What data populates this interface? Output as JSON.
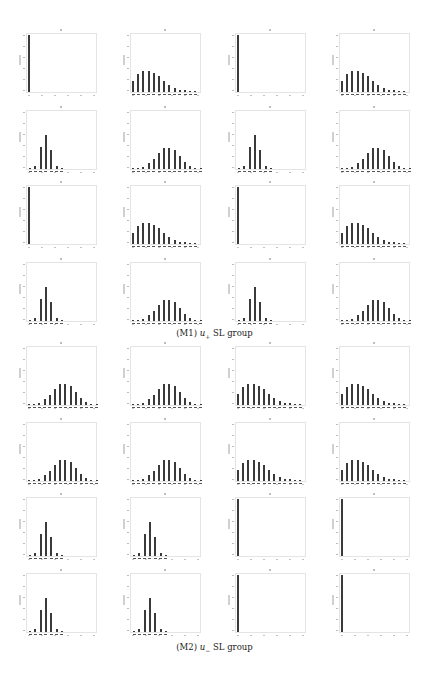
{
  "figure": {
    "panels": [
      {
        "id": "M1",
        "caption_prefix": "(M1) ",
        "caption_var": "u",
        "caption_sub": "+",
        "caption_suffix": " SL group"
      },
      {
        "id": "M2",
        "caption_prefix": "(M2) ",
        "caption_var": "u",
        "caption_sub": "−",
        "caption_suffix": " SL group"
      }
    ]
  },
  "chart_data": [
    {
      "type": "bar",
      "panel": "(M1) u+ SL group",
      "grid": {
        "rows": 4,
        "cols": 4
      },
      "layout_note": "small-multiple histograms; tick labels illegible at this resolution",
      "histograms": [
        {
          "row": 0,
          "col": 0,
          "shape": "spike",
          "values": [
            1.0
          ]
        },
        {
          "row": 0,
          "col": 1,
          "shape": "right-skewed",
          "values": [
            0.2,
            0.32,
            0.37,
            0.37,
            0.34,
            0.28,
            0.2,
            0.13,
            0.07,
            0.04,
            0.03,
            0.02,
            0.01
          ]
        },
        {
          "row": 0,
          "col": 2,
          "shape": "spike",
          "values": [
            1.0
          ]
        },
        {
          "row": 0,
          "col": 3,
          "shape": "right-skewed",
          "values": [
            0.2,
            0.32,
            0.37,
            0.37,
            0.34,
            0.28,
            0.2,
            0.13,
            0.07,
            0.04,
            0.03,
            0.02,
            0.01
          ]
        },
        {
          "row": 1,
          "col": 0,
          "shape": "narrow-peak",
          "values": [
            0.02,
            0.06,
            0.38,
            0.6,
            0.33,
            0.06,
            0.02
          ]
        },
        {
          "row": 1,
          "col": 1,
          "shape": "centered",
          "values": [
            0.01,
            0.02,
            0.04,
            0.1,
            0.18,
            0.28,
            0.36,
            0.37,
            0.33,
            0.22,
            0.12,
            0.05,
            0.02,
            0.01
          ]
        },
        {
          "row": 1,
          "col": 2,
          "shape": "narrow-peak",
          "values": [
            0.02,
            0.06,
            0.38,
            0.6,
            0.33,
            0.06,
            0.02
          ]
        },
        {
          "row": 1,
          "col": 3,
          "shape": "centered",
          "values": [
            0.01,
            0.02,
            0.04,
            0.1,
            0.18,
            0.28,
            0.36,
            0.37,
            0.33,
            0.22,
            0.12,
            0.05,
            0.02,
            0.01
          ]
        },
        {
          "row": 2,
          "col": 0,
          "shape": "spike",
          "values": [
            1.0
          ]
        },
        {
          "row": 2,
          "col": 1,
          "shape": "right-skewed",
          "values": [
            0.2,
            0.32,
            0.37,
            0.37,
            0.34,
            0.28,
            0.2,
            0.13,
            0.07,
            0.04,
            0.03,
            0.02,
            0.01
          ]
        },
        {
          "row": 2,
          "col": 2,
          "shape": "spike",
          "values": [
            1.0
          ]
        },
        {
          "row": 2,
          "col": 3,
          "shape": "right-skewed",
          "values": [
            0.2,
            0.32,
            0.37,
            0.37,
            0.34,
            0.28,
            0.2,
            0.13,
            0.07,
            0.04,
            0.03,
            0.02,
            0.01
          ]
        },
        {
          "row": 3,
          "col": 0,
          "shape": "narrow-peak",
          "values": [
            0.02,
            0.06,
            0.38,
            0.6,
            0.33,
            0.06,
            0.02
          ]
        },
        {
          "row": 3,
          "col": 1,
          "shape": "centered",
          "values": [
            0.01,
            0.02,
            0.04,
            0.1,
            0.18,
            0.28,
            0.36,
            0.37,
            0.33,
            0.22,
            0.12,
            0.05,
            0.02,
            0.01
          ]
        },
        {
          "row": 3,
          "col": 2,
          "shape": "narrow-peak",
          "values": [
            0.02,
            0.06,
            0.38,
            0.6,
            0.33,
            0.06,
            0.02
          ]
        },
        {
          "row": 3,
          "col": 3,
          "shape": "centered",
          "values": [
            0.01,
            0.02,
            0.04,
            0.1,
            0.18,
            0.28,
            0.36,
            0.37,
            0.33,
            0.22,
            0.12,
            0.05,
            0.02,
            0.01
          ]
        }
      ]
    },
    {
      "type": "bar",
      "panel": "(M2) u− SL group",
      "grid": {
        "rows": 4,
        "cols": 4
      },
      "layout_note": "small-multiple histograms; tick labels illegible at this resolution",
      "histograms": [
        {
          "row": 0,
          "col": 0,
          "shape": "centered",
          "values": [
            0.01,
            0.02,
            0.04,
            0.1,
            0.18,
            0.28,
            0.36,
            0.37,
            0.33,
            0.22,
            0.12,
            0.05,
            0.02,
            0.01
          ]
        },
        {
          "row": 0,
          "col": 1,
          "shape": "centered",
          "values": [
            0.01,
            0.02,
            0.04,
            0.1,
            0.18,
            0.28,
            0.36,
            0.37,
            0.33,
            0.22,
            0.12,
            0.05,
            0.02,
            0.01
          ]
        },
        {
          "row": 0,
          "col": 2,
          "shape": "right-skewed",
          "values": [
            0.2,
            0.32,
            0.37,
            0.37,
            0.34,
            0.28,
            0.2,
            0.13,
            0.07,
            0.04,
            0.03,
            0.02,
            0.01
          ]
        },
        {
          "row": 0,
          "col": 3,
          "shape": "right-skewed",
          "values": [
            0.2,
            0.32,
            0.37,
            0.37,
            0.34,
            0.28,
            0.2,
            0.13,
            0.07,
            0.04,
            0.03,
            0.02,
            0.01
          ]
        },
        {
          "row": 1,
          "col": 0,
          "shape": "centered",
          "values": [
            0.01,
            0.02,
            0.04,
            0.1,
            0.18,
            0.28,
            0.36,
            0.37,
            0.33,
            0.22,
            0.12,
            0.05,
            0.02,
            0.01
          ]
        },
        {
          "row": 1,
          "col": 1,
          "shape": "centered",
          "values": [
            0.01,
            0.02,
            0.04,
            0.1,
            0.18,
            0.28,
            0.36,
            0.37,
            0.33,
            0.22,
            0.12,
            0.05,
            0.02,
            0.01
          ]
        },
        {
          "row": 1,
          "col": 2,
          "shape": "right-skewed",
          "values": [
            0.2,
            0.32,
            0.37,
            0.37,
            0.34,
            0.28,
            0.2,
            0.13,
            0.07,
            0.04,
            0.03,
            0.02,
            0.01
          ]
        },
        {
          "row": 1,
          "col": 3,
          "shape": "right-skewed",
          "values": [
            0.2,
            0.32,
            0.37,
            0.37,
            0.34,
            0.28,
            0.2,
            0.13,
            0.07,
            0.04,
            0.03,
            0.02,
            0.01
          ]
        },
        {
          "row": 2,
          "col": 0,
          "shape": "narrow-peak",
          "values": [
            0.02,
            0.06,
            0.38,
            0.6,
            0.33,
            0.06,
            0.02
          ]
        },
        {
          "row": 2,
          "col": 1,
          "shape": "narrow-peak",
          "values": [
            0.02,
            0.06,
            0.38,
            0.6,
            0.33,
            0.06,
            0.02
          ]
        },
        {
          "row": 2,
          "col": 2,
          "shape": "spike",
          "values": [
            1.0
          ]
        },
        {
          "row": 2,
          "col": 3,
          "shape": "spike",
          "values": [
            1.0
          ]
        },
        {
          "row": 3,
          "col": 0,
          "shape": "narrow-peak",
          "values": [
            0.02,
            0.06,
            0.38,
            0.6,
            0.33,
            0.06,
            0.02
          ]
        },
        {
          "row": 3,
          "col": 1,
          "shape": "narrow-peak",
          "values": [
            0.02,
            0.06,
            0.38,
            0.6,
            0.33,
            0.06,
            0.02
          ]
        },
        {
          "row": 3,
          "col": 2,
          "shape": "spike",
          "values": [
            1.0
          ]
        },
        {
          "row": 3,
          "col": 3,
          "shape": "spike",
          "values": [
            1.0
          ]
        }
      ]
    }
  ],
  "layout": {
    "col_x": [
      26,
      130,
      235,
      339
    ],
    "rows_y": [
      [
        33,
        110,
        185,
        262
      ],
      [
        346,
        422,
        497,
        573
      ]
    ],
    "caption_y": [
      328,
      642
    ],
    "bar_color": "#3a3a3a",
    "frame_color": "#e4e4e4"
  }
}
